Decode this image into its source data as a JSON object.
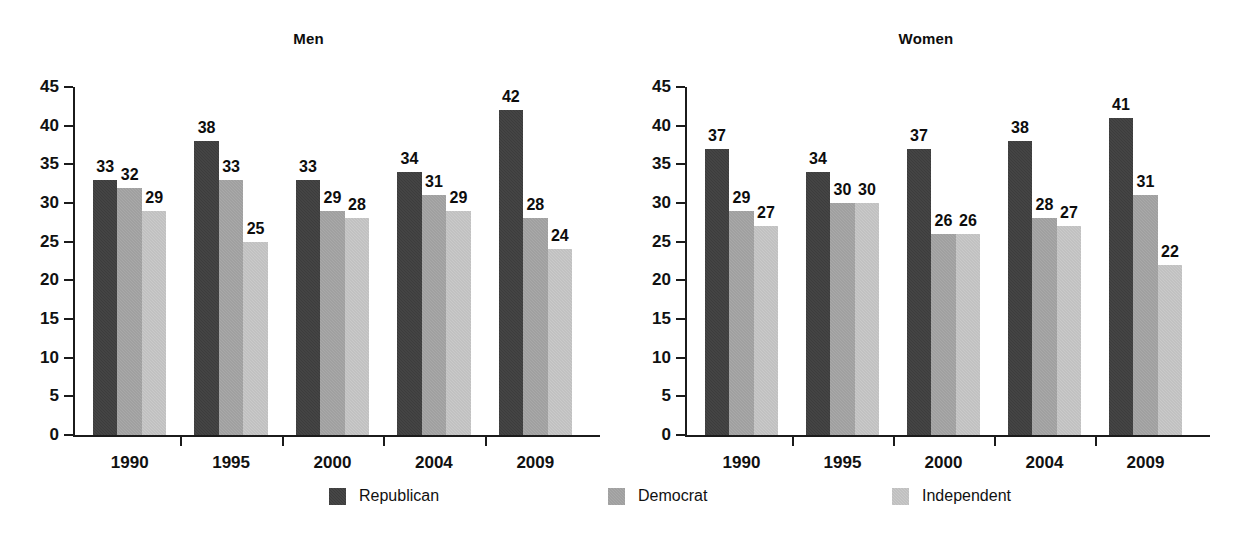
{
  "legend": {
    "position": "bottom-center",
    "entries": [
      {
        "label": "Republican",
        "color": "#3c3c3c"
      },
      {
        "label": "Democrat",
        "color": "#a9a9a9"
      },
      {
        "label": "Independent",
        "color": "#cacaca"
      }
    ]
  },
  "chart_data": [
    {
      "type": "bar",
      "title": "Men",
      "xlabel": "",
      "ylabel": "",
      "ylim": [
        0,
        45
      ],
      "yticks": [
        0,
        5,
        10,
        15,
        20,
        25,
        30,
        35,
        40,
        45
      ],
      "grid": false,
      "categories": [
        "1990",
        "1995",
        "2000",
        "2004",
        "2009"
      ],
      "series": [
        {
          "name": "Republican",
          "color": "#3c3c3c",
          "values": [
            33,
            38,
            33,
            34,
            42
          ]
        },
        {
          "name": "Democrat",
          "color": "#a9a9a9",
          "values": [
            32,
            33,
            29,
            31,
            28
          ]
        },
        {
          "name": "Independent",
          "color": "#cacaca",
          "values": [
            29,
            25,
            28,
            29,
            24
          ]
        }
      ]
    },
    {
      "type": "bar",
      "title": "Women",
      "xlabel": "",
      "ylabel": "",
      "ylim": [
        0,
        45
      ],
      "yticks": [
        0,
        5,
        10,
        15,
        20,
        25,
        30,
        35,
        40,
        45
      ],
      "grid": false,
      "categories": [
        "1990",
        "1995",
        "2000",
        "2004",
        "2009"
      ],
      "series": [
        {
          "name": "Republican",
          "color": "#3c3c3c",
          "values": [
            37,
            34,
            37,
            38,
            41
          ]
        },
        {
          "name": "Democrat",
          "color": "#a9a9a9",
          "values": [
            29,
            30,
            26,
            28,
            31
          ]
        },
        {
          "name": "Independent",
          "color": "#cacaca",
          "values": [
            27,
            30,
            26,
            27,
            22
          ]
        }
      ]
    }
  ]
}
